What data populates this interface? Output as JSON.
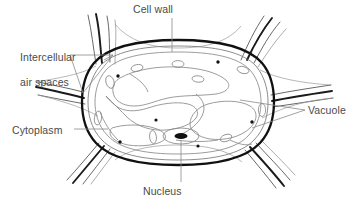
{
  "figure": {
    "background_color": "#ffffff",
    "line_color": "#1a1a1a",
    "thin_line_color": "#6e6e6e",
    "leader_color": "#6e6e6e",
    "text_color": "#4a4a4a"
  },
  "labels": {
    "cell_wall": "Cell wall",
    "intercellular_line1": "Intercellular",
    "intercellular_line2": "air spaces",
    "cytoplasm": "Cytoplasm",
    "vacuole": "Vacuole",
    "nucleus": "Nucleus"
  },
  "structures": {
    "cell_wall": "thick dark outer boundary of the plant cell",
    "cytoplasm": "thin strands lining the inside of the cell wall",
    "vacuole": "large pale lobed regions filling the cell interior",
    "nucleus": "small dark filled ellipse near lower centre",
    "intercellular_air_spaces": "triangular gaps where neighbouring cell walls meet",
    "organelle_dots": 6,
    "small_vacuole_ovals": 9,
    "neighbouring_wall_branches": 6
  }
}
